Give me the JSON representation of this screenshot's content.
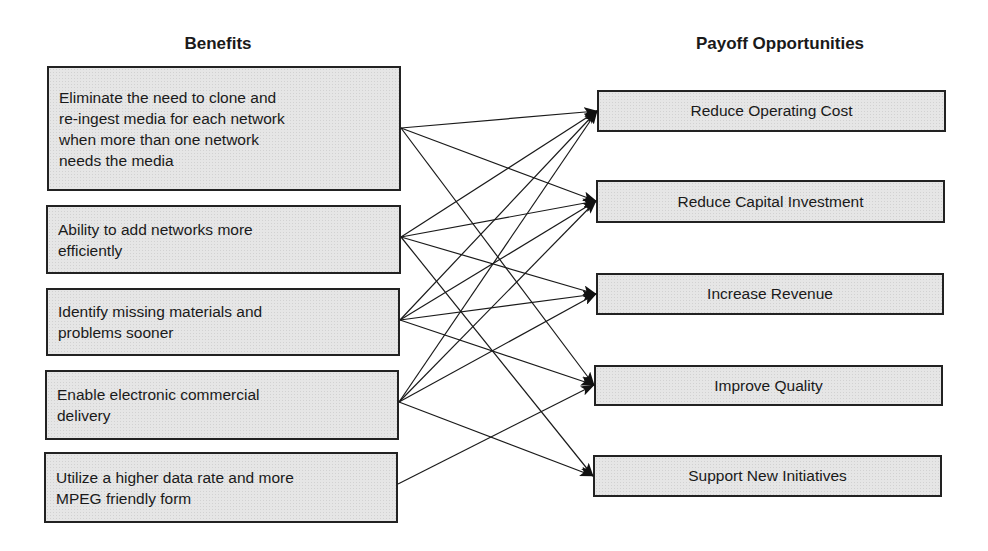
{
  "headings": {
    "benefits": "Benefits",
    "payoffs": "Payoff Opportunities"
  },
  "benefits": [
    {
      "id": "B1",
      "label": "Eliminate the need to clone and\nre-ingest media for each network\nwhen more than one network\nneeds the media"
    },
    {
      "id": "B2",
      "label": "Ability to add networks more\nefficiently"
    },
    {
      "id": "B3",
      "label": "Identify missing materials and\nproblems sooner"
    },
    {
      "id": "B4",
      "label": "Enable electronic commercial\ndelivery"
    },
    {
      "id": "B5",
      "label": "Utilize a higher data rate and more\nMPEG friendly form"
    }
  ],
  "payoffs": [
    {
      "id": "P1",
      "label": "Reduce Operating Cost"
    },
    {
      "id": "P2",
      "label": "Reduce Capital Investment"
    },
    {
      "id": "P3",
      "label": "Increase Revenue"
    },
    {
      "id": "P4",
      "label": "Improve Quality"
    },
    {
      "id": "P5",
      "label": "Support New Initiatives"
    }
  ],
  "links": [
    [
      "B1",
      "P1"
    ],
    [
      "B1",
      "P2"
    ],
    [
      "B1",
      "P4"
    ],
    [
      "B2",
      "P1"
    ],
    [
      "B2",
      "P2"
    ],
    [
      "B2",
      "P3"
    ],
    [
      "B2",
      "P5"
    ],
    [
      "B3",
      "P1"
    ],
    [
      "B3",
      "P2"
    ],
    [
      "B3",
      "P3"
    ],
    [
      "B3",
      "P4"
    ],
    [
      "B4",
      "P1"
    ],
    [
      "B4",
      "P2"
    ],
    [
      "B4",
      "P3"
    ],
    [
      "B4",
      "P5"
    ],
    [
      "B5",
      "P4"
    ]
  ],
  "colors": {
    "box_fill": "#e6e6e6",
    "box_border": "#222222",
    "line": "#1a1a1a"
  }
}
